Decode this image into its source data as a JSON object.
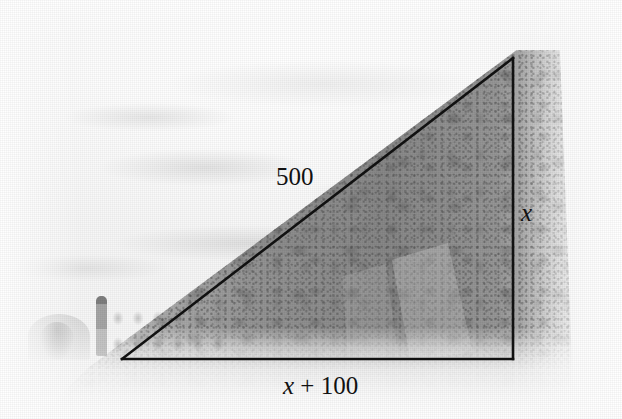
{
  "figure": {
    "kind": "geometry-diagram-over-photograph",
    "scene_description": "Faded black-and-white photograph of a forested hillside with a campsite tent and a standing person at lower left; a right triangle is drawn over the hill.",
    "width": 622,
    "height": 419
  },
  "triangle": {
    "type": "right-triangle",
    "stroke_color": "#111111",
    "stroke_width": 2.6,
    "vertices": {
      "bottom_left": {
        "x": 122,
        "y": 359
      },
      "bottom_right": {
        "x": 513,
        "y": 359
      },
      "apex": {
        "x": 513,
        "y": 58
      }
    },
    "right_angle_at": "bottom_right"
  },
  "labels": {
    "hypotenuse": {
      "text": "500",
      "italic_part": "",
      "roman_part": "500"
    },
    "vertical": {
      "text": "x",
      "italic_part": "x",
      "roman_part": ""
    },
    "base": {
      "text": "x + 100",
      "italic_part": "x",
      "roman_part": " + 100"
    }
  },
  "scene_elements": {
    "tent_label": "dome tent",
    "person_label": "standing person",
    "hillside_label": "forested hillside",
    "cliff_label": "rock face",
    "sky_label": "overcast sky",
    "ground_label": "pale foreground ground"
  },
  "colors": {
    "line": "#111111",
    "label_text": "#111111",
    "paper": "#ffffff",
    "sky": "#f7f7f7",
    "forest": "#787878",
    "ground": "#f2f2f2"
  }
}
